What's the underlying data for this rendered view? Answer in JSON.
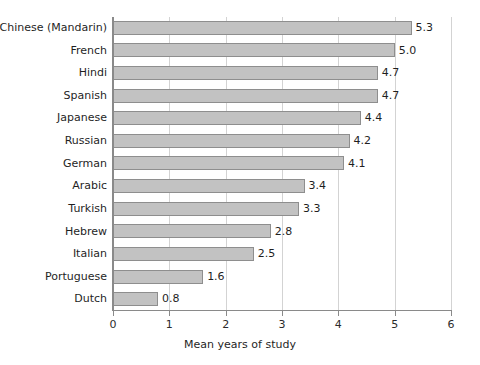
{
  "chart_data": {
    "type": "bar",
    "orientation": "horizontal",
    "title": "",
    "xlabel": "Mean years of study",
    "ylabel": "",
    "xlim": [
      0,
      6
    ],
    "xticks": [
      "0",
      "1",
      "2",
      "3",
      "4",
      "5",
      "6"
    ],
    "grid": "vertical",
    "legend": "none",
    "value_label_format": "one decimal",
    "categories": [
      "Chinese (Mandarin)",
      "French",
      "Hindi",
      "Spanish",
      "Japanese",
      "Russian",
      "German",
      "Arabic",
      "Turkish",
      "Hebrew",
      "Italian",
      "Portuguese",
      "Dutch"
    ],
    "values": [
      5.3,
      5.0,
      4.7,
      4.7,
      4.4,
      4.2,
      4.1,
      3.4,
      3.3,
      2.8,
      2.5,
      1.6,
      0.8
    ],
    "value_labels": [
      "5.3",
      "5.0",
      "4.7",
      "4.7",
      "4.4",
      "4.2",
      "4.1",
      "3.4",
      "3.3",
      "2.8",
      "2.5",
      "1.6",
      "0.8"
    ],
    "colors": {
      "bar_fill": "#c2c2c2",
      "bar_border": "#8e8e8e",
      "gridline": "#d3d3d3",
      "axis": "#8a8a8a",
      "text": "#1f1f1f",
      "background": "#ffffff"
    }
  }
}
